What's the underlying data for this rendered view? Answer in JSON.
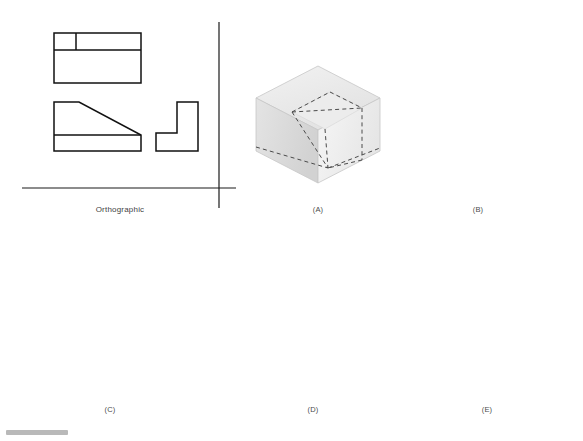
{
  "page": {
    "width": 583,
    "height": 441,
    "background": "#ffffff",
    "ink": "#1a1a1a",
    "hidden_line_color": "#4a4a4a",
    "caption_color": "#4a4a4a"
  },
  "orthographic": {
    "label": "Orthographic",
    "axis": {
      "vertical_x": 219,
      "vertical_y1": 22,
      "vertical_y2": 208,
      "horizontal_y": 188,
      "horizontal_x1": 22,
      "horizontal_x2": 236,
      "color": "#1a1a1a"
    },
    "views": [
      {
        "name": "top-view",
        "description": "Rectangle divided by a horizontal line with a short vertical divider in the upper band",
        "x": 54,
        "y": 33,
        "width": 87,
        "height": 50,
        "divider_y_offset": 17,
        "vertical_divider_x_offset": 22
      },
      {
        "name": "front-view",
        "description": "Profile with flat top-left, diagonal incline down to the right, and a base band",
        "x": 54,
        "y": 102,
        "width": 87,
        "height": 49,
        "top_flat_width": 25,
        "base_band_y_offset": 33
      },
      {
        "name": "side-view",
        "description": "L-shaped right side view",
        "x": 156,
        "y": 102,
        "width": 60,
        "height": 49,
        "leg_width": 21,
        "base_height": 18
      }
    ]
  },
  "options": [
    {
      "id": "A",
      "label": "(A)",
      "name": "option-a",
      "description": "Isometric block with dashed hidden construction lines showing the cut layout",
      "has_knife": false,
      "knife_state": "none",
      "caption_x": 318,
      "caption_y": 210
    },
    {
      "id": "B",
      "label": "(B)",
      "name": "option-b",
      "description": "Isometric block with dashed layout lines and a knife poised above the block",
      "has_knife": true,
      "knife_state": "above",
      "caption_x": 478,
      "caption_y": 210
    },
    {
      "id": "C",
      "label": "(C)",
      "name": "option-c",
      "description": "Isometric block with the knife cutting down into the top surface along the layout lines",
      "has_knife": true,
      "knife_state": "cutting-top",
      "caption_x": 110,
      "caption_y": 410
    },
    {
      "id": "D",
      "label": "(D)",
      "name": "option-d",
      "description": "Stepped L-shaped block with the knife carving the inclined surface",
      "has_knife": true,
      "knife_state": "carving-step",
      "caption_x": 313,
      "caption_y": 410
    },
    {
      "id": "E",
      "label": "(E)",
      "name": "option-e",
      "description": "Completed solid: L-shaped base with an inclined ramp face, no hidden lines",
      "has_knife": false,
      "knife_state": "none",
      "caption_x": 487,
      "caption_y": 410
    }
  ],
  "shading": {
    "top_face": "#e9e9e9",
    "left_face": "#dadada",
    "right_face": "#f1f1f1",
    "ramp_face": "#ebebeb",
    "edge": "#c2c2c2",
    "knife_blade_light": "#fbfbfb",
    "knife_blade_mid": "#d8d8d8",
    "knife_blade_dark": "#9a9a9a",
    "knife_outline": "#2b2b2b",
    "knife_handle": "#f4f4f4"
  }
}
